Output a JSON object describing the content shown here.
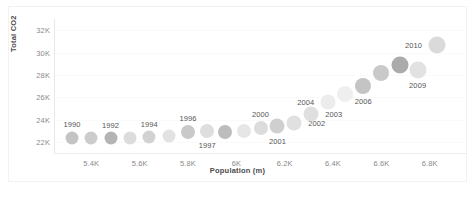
{
  "chart_data": {
    "type": "scatter",
    "title": "",
    "subtitle": "",
    "xlabel": "Population (m)",
    "ylabel": "Total CO2",
    "xlim": [
      5250,
      6950
    ],
    "ylim": [
      21000,
      33000
    ],
    "grid": false,
    "legend": "none",
    "xticks": [
      "5.4K",
      "5.6K",
      "5.8K",
      "6K",
      "6.2K",
      "6.4K",
      "6.6K",
      "6.8K"
    ],
    "xtick_values": [
      5400,
      5600,
      5800,
      6000,
      6200,
      6400,
      6600,
      6800
    ],
    "yticks": [
      "32K",
      "30K",
      "28K",
      "26K",
      "24K",
      "22K"
    ],
    "ytick_values": [
      32000,
      30000,
      28000,
      26000,
      24000,
      22000
    ],
    "series": [
      {
        "name": "Years 1990-2010",
        "points": [
          {
            "year": "1990",
            "x": 5320,
            "y": 22350,
            "size": 13,
            "color": "#c4c4c4",
            "label": "1990",
            "label_pos": "above"
          },
          {
            "year": "1991",
            "x": 5400,
            "y": 22300,
            "size": 13,
            "color": "#cccccc",
            "label": "",
            "label_pos": "none"
          },
          {
            "year": "1992",
            "x": 5480,
            "y": 22300,
            "size": 13,
            "color": "#b4b4b4",
            "label": "1992",
            "label_pos": "above"
          },
          {
            "year": "1993",
            "x": 5560,
            "y": 22330,
            "size": 13,
            "color": "#dcdcdc",
            "label": "",
            "label_pos": "none"
          },
          {
            "year": "1994",
            "x": 5640,
            "y": 22400,
            "size": 13,
            "color": "#d2d2d2",
            "label": "1994",
            "label_pos": "above"
          },
          {
            "year": "1995",
            "x": 5720,
            "y": 22500,
            "size": 13,
            "color": "#e2e2e2",
            "label": "",
            "label_pos": "none"
          },
          {
            "year": "1996",
            "x": 5800,
            "y": 22850,
            "size": 14,
            "color": "#c9c9c9",
            "label": "1996",
            "label_pos": "above"
          },
          {
            "year": "1997",
            "x": 5880,
            "y": 23000,
            "size": 14,
            "color": "#dedede",
            "label": "1997",
            "label_pos": "below"
          },
          {
            "year": "1998",
            "x": 5955,
            "y": 22900,
            "size": 14,
            "color": "#bdbdbd",
            "label": "",
            "label_pos": "none"
          },
          {
            "year": "1999",
            "x": 6030,
            "y": 22950,
            "size": 14,
            "color": "#e6e6e6",
            "label": "",
            "label_pos": "none"
          },
          {
            "year": "2000",
            "x": 6100,
            "y": 23250,
            "size": 14,
            "color": "#dcdcdc",
            "label": "2000",
            "label_pos": "above"
          },
          {
            "year": "2001",
            "x": 6170,
            "y": 23400,
            "size": 15,
            "color": "#cfcfcf",
            "label": "2001",
            "label_pos": "below"
          },
          {
            "year": "2002",
            "x": 6240,
            "y": 23700,
            "size": 15,
            "color": "#e0e0e0",
            "label": "2002",
            "label_pos": "right"
          },
          {
            "year": "2003",
            "x": 6310,
            "y": 24500,
            "size": 15,
            "color": "#dfdfdf",
            "label": "2003",
            "label_pos": "right"
          },
          {
            "year": "2004",
            "x": 6380,
            "y": 25550,
            "size": 15,
            "color": "#ececec",
            "label": "2004",
            "label_pos": "left"
          },
          {
            "year": "2005",
            "x": 6450,
            "y": 26300,
            "size": 16,
            "color": "#efefef",
            "label": "",
            "label_pos": "none"
          },
          {
            "year": "2006",
            "x": 6525,
            "y": 27000,
            "size": 16,
            "color": "#c4c4c4",
            "label": "2006",
            "label_pos": "below"
          },
          {
            "year": "2007",
            "x": 6600,
            "y": 28150,
            "size": 16,
            "color": "#c9c9c9",
            "label": "",
            "label_pos": "none"
          },
          {
            "year": "2008",
            "x": 6675,
            "y": 28900,
            "size": 17,
            "color": "#ababab",
            "label": "",
            "label_pos": "none"
          },
          {
            "year": "2009",
            "x": 6750,
            "y": 28450,
            "size": 17,
            "color": "#e2e2e2",
            "label": "2009",
            "label_pos": "below"
          },
          {
            "year": "2010",
            "x": 6830,
            "y": 30700,
            "size": 17,
            "color": "#dadada",
            "label": "2010",
            "label_pos": "left"
          }
        ]
      }
    ]
  }
}
